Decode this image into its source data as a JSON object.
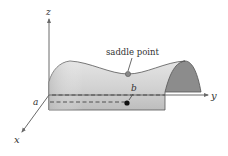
{
  "diagram": {
    "type": "3d-surface-saddle",
    "axes": {
      "x_label": "x",
      "y_label": "y",
      "z_label": "z"
    },
    "annotations": {
      "saddle_label": "saddle point",
      "a_label": "a",
      "b_label": "b"
    },
    "colors": {
      "surface_front": "#c9c9c9",
      "surface_highlight": "#e2e2e2",
      "surface_cap": "#8c8c8c",
      "outline": "#555555",
      "axis": "#6a6a6a",
      "point": "#111111",
      "saddle_point": "#888888"
    }
  }
}
